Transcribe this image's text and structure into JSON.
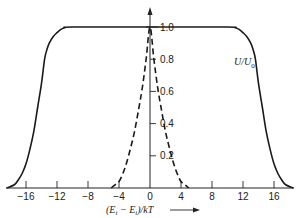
{
  "chart_data": {
    "type": "line",
    "title": "",
    "xlabel": "(E_t − E_i)/kT →",
    "ylabel": "U/U_0",
    "xlim": [
      -18.5,
      18.5
    ],
    "ylim": [
      0,
      1.0
    ],
    "grid": false,
    "legend": null,
    "x_ticks": [
      -16,
      -12,
      -8,
      -4,
      0,
      4,
      8,
      12,
      16
    ],
    "x_tick_labels": [
      "−16",
      "−12",
      "−8",
      "−4",
      "0",
      "4",
      "8",
      "12",
      "16"
    ],
    "y_ticks": [
      0.2,
      0.4,
      0.6,
      0.8,
      1.0
    ],
    "y_tick_labels": [
      "0.2",
      "0.4",
      "0.6",
      "0.8",
      "1.0"
    ],
    "series": [
      {
        "name": "solid",
        "style": "solid",
        "x": [
          -18.5,
          -17.5,
          -17,
          -16.5,
          -16,
          -15.5,
          -15,
          -14.5,
          -14,
          -13.6,
          -13.3,
          -13,
          -12.5,
          -12,
          -11.5,
          -11,
          -10,
          0,
          10,
          11,
          11.5,
          12,
          12.5,
          13,
          13.3,
          13.6,
          14,
          14.5,
          15,
          15.5,
          16,
          16.5,
          17,
          17.5,
          18.5
        ],
        "y": [
          0.0,
          0.02,
          0.05,
          0.09,
          0.15,
          0.24,
          0.35,
          0.5,
          0.65,
          0.8,
          0.86,
          0.9,
          0.94,
          0.965,
          0.985,
          0.995,
          1.0,
          1.0,
          1.0,
          0.995,
          0.985,
          0.965,
          0.94,
          0.9,
          0.86,
          0.8,
          0.65,
          0.5,
          0.35,
          0.24,
          0.15,
          0.09,
          0.05,
          0.02,
          0.0
        ]
      },
      {
        "name": "dashed",
        "style": "dashed",
        "x": [
          -5,
          -4.5,
          -4,
          -3.5,
          -3,
          -2.5,
          -2,
          -1.5,
          -1,
          -0.5,
          0,
          0.5,
          1,
          1.5,
          2,
          2.5,
          3,
          3.5,
          4,
          4.5,
          5
        ],
        "y": [
          0.0,
          0.02,
          0.04,
          0.09,
          0.16,
          0.25,
          0.35,
          0.48,
          0.62,
          0.8,
          1.0,
          0.8,
          0.62,
          0.48,
          0.35,
          0.25,
          0.16,
          0.09,
          0.04,
          0.02,
          0.0
        ]
      }
    ],
    "annotations": [
      {
        "text": "U/U",
        "sub": "0",
        "x": 11,
        "y": 0.78
      }
    ]
  },
  "labels": {
    "y_axis_label_main": "U/U",
    "y_axis_label_sub": "0",
    "x_axis_label_open": "(E",
    "x_axis_label_sub1": "t",
    "x_axis_label_mid": " − E",
    "x_axis_label_sub2": "i",
    "x_axis_label_close": ")/kT"
  }
}
